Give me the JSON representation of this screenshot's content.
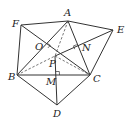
{
  "figure": {
    "type": "geometry-diagram",
    "points": {
      "A": {
        "label": "A",
        "x": 68,
        "y": 21,
        "lx": 64,
        "ly": 16
      },
      "E": {
        "label": "E",
        "x": 113,
        "y": 30,
        "lx": 117,
        "ly": 33
      },
      "F": {
        "label": "F",
        "x": 21,
        "y": 25,
        "lx": 12,
        "ly": 27
      },
      "O": {
        "label": "O",
        "x": 45,
        "y": 46,
        "lx": 35,
        "ly": 50
      },
      "N": {
        "label": "N",
        "x": 78,
        "y": 48,
        "lx": 82,
        "ly": 51
      },
      "P": {
        "label": "P",
        "x": 55,
        "y": 56,
        "lx": 49,
        "ly": 67
      },
      "B": {
        "label": "B",
        "x": 17,
        "y": 75,
        "lx": 8,
        "ly": 80
      },
      "M": {
        "label": "M",
        "x": 56,
        "y": 75,
        "lx": 46,
        "ly": 85
      },
      "C": {
        "label": "C",
        "x": 90,
        "y": 75,
        "lx": 93,
        "ly": 82
      },
      "D": {
        "label": "D",
        "x": 57,
        "y": 105,
        "lx": 53,
        "ly": 117
      }
    },
    "solid_segments": [
      [
        "F",
        "A"
      ],
      [
        "A",
        "E"
      ],
      [
        "F",
        "B"
      ],
      [
        "B",
        "A"
      ],
      [
        "F",
        "C"
      ],
      [
        "A",
        "C"
      ],
      [
        "E",
        "P"
      ],
      [
        "E",
        "C"
      ],
      [
        "B",
        "C"
      ],
      [
        "B",
        "D"
      ],
      [
        "D",
        "C"
      ],
      [
        "P",
        "D"
      ]
    ],
    "dashed_segments": [
      [
        "A",
        "P"
      ],
      [
        "B",
        "P"
      ],
      [
        "P",
        "C"
      ]
    ],
    "right_angles": [
      "O",
      "N",
      "M"
    ]
  }
}
